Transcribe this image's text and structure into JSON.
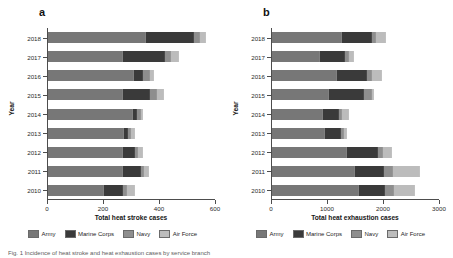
{
  "figure": {
    "caption": "Fig. 1 Incidence of heat stroke and heat exhaustion cases by service branch"
  },
  "legend": {
    "items": [
      {
        "key": "army",
        "label": "Army",
        "color": "#777777"
      },
      {
        "key": "marine",
        "label": "Marine Corps",
        "color": "#3a3a3a"
      },
      {
        "key": "navy",
        "label": "Navy",
        "color": "#8e8e8e"
      },
      {
        "key": "air",
        "label": "Air Force",
        "color": "#bcbcbc"
      }
    ]
  },
  "panels": {
    "a": {
      "letter": "a",
      "ylabel": "Year"
    },
    "b": {
      "letter": "b",
      "ylabel": "Year"
    }
  },
  "chart_data": [
    {
      "type": "bar",
      "orientation": "horizontal",
      "stacked": true,
      "panel": "a",
      "title": "",
      "xlabel": "Total heat stroke cases",
      "ylabel": "Year",
      "xlim": [
        0,
        600
      ],
      "xticks": [
        0,
        200,
        400,
        600
      ],
      "xtick_labels": [
        "0",
        "200",
        "400",
        "600"
      ],
      "grid": false,
      "legend_position": "bottom",
      "categories": [
        "2018",
        "2017",
        "2016",
        "2015",
        "2014",
        "2013",
        "2012",
        "2011",
        "2010"
      ],
      "series": [
        {
          "name": "Army",
          "values": [
            348,
            266,
            305,
            265,
            300,
            268,
            264,
            265,
            198
          ]
        },
        {
          "name": "Marine Corps",
          "values": [
            165,
            145,
            28,
            93,
            12,
            10,
            38,
            60,
            62
          ]
        },
        {
          "name": "Navy",
          "values": [
            18,
            16,
            20,
            22,
            8,
            8,
            10,
            8,
            12
          ]
        },
        {
          "name": "Air Force",
          "values": [
            20,
            25,
            13,
            21,
            6,
            9,
            14,
            14,
            24
          ]
        }
      ],
      "totals": [
        551,
        452,
        366,
        401,
        326,
        295,
        326,
        347,
        296
      ]
    },
    {
      "type": "bar",
      "orientation": "horizontal",
      "stacked": true,
      "panel": "b",
      "title": "",
      "xlabel": "Total heat exhaustion cases",
      "ylabel": "Year",
      "xlim": [
        0,
        3000
      ],
      "xticks": [
        0,
        1000,
        2000,
        3000
      ],
      "xtick_labels": [
        "0",
        "1000",
        "2000",
        "3000"
      ],
      "grid": false,
      "legend_position": "bottom",
      "categories": [
        "2018",
        "2017",
        "2016",
        "2015",
        "2014",
        "2013",
        "2012",
        "2011",
        "2010"
      ],
      "series": [
        {
          "name": "Army",
          "values": [
            1230,
            835,
            1140,
            1005,
            900,
            930,
            1330,
            1470,
            1530
          ]
        },
        {
          "name": "Marine Corps",
          "values": [
            520,
            425,
            515,
            600,
            260,
            260,
            530,
            500,
            460
          ]
        },
        {
          "name": "Navy",
          "values": [
            60,
            55,
            85,
            130,
            30,
            45,
            60,
            130,
            130
          ]
        },
        {
          "name": "Air Force",
          "values": [
            150,
            70,
            145,
            20,
            110,
            30,
            150,
            480,
            355
          ]
        }
      ],
      "totals": [
        1960,
        1385,
        1885,
        1755,
        1300,
        1265,
        2070,
        2580,
        2475
      ]
    }
  ]
}
